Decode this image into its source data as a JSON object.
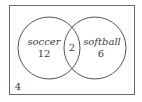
{
  "diagram": {
    "type": "venn",
    "sets": [
      {
        "name": "soccer",
        "label": "soccer",
        "only_count": "12"
      },
      {
        "name": "softball",
        "label": "softball",
        "only_count": "6"
      }
    ],
    "intersection": {
      "sets": [
        "soccer",
        "softball"
      ],
      "count": "2"
    },
    "outside": {
      "count": "4"
    },
    "colors": {
      "stroke": "#555555",
      "text": "#3a3a3a"
    }
  }
}
